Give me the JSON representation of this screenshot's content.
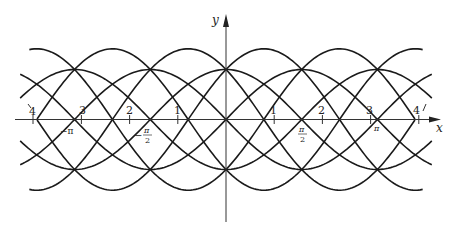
{
  "chart_data": {
    "type": "line",
    "title": "",
    "xlabel": "x",
    "ylabel": "y",
    "xlim": [
      -4.35,
      4.45
    ],
    "ylim": [
      -2.0,
      2.1
    ],
    "grid": false,
    "legend": null,
    "x_ticks": [
      -4,
      -3,
      -2,
      -1,
      1,
      2,
      3,
      4
    ],
    "x_tick_labels": [
      "4",
      "3",
      "2",
      "1",
      "1",
      "2",
      "3",
      "4"
    ],
    "special_labels": [
      {
        "x": -3.14159,
        "text": "−π"
      },
      {
        "x": -1.5708,
        "text": "−π/2"
      },
      {
        "x": 1.5708,
        "text": "π/2"
      },
      {
        "x": 3.14159,
        "text": "π"
      }
    ],
    "series": [
      {
        "name": "sin x",
        "a": 1,
        "b": 0,
        "x_range": [
          -4.27,
          4.27
        ]
      },
      {
        "name": "−sin x",
        "a": -1,
        "b": 0,
        "x_range": [
          -4.27,
          4.27
        ]
      },
      {
        "name": "cos x",
        "a": 0,
        "b": 1,
        "x_range": [
          -4.27,
          4.27
        ]
      },
      {
        "name": "−cos x",
        "a": 0,
        "b": -1,
        "x_range": [
          -4.27,
          4.27
        ]
      },
      {
        "name": "sin x + cos x",
        "a": 1,
        "b": 1,
        "x_range": [
          -3.92,
          4.08
        ]
      },
      {
        "name": "−sin x − cos x",
        "a": -1,
        "b": -1,
        "x_range": [
          -3.92,
          4.08
        ]
      },
      {
        "name": "sin x − cos x",
        "a": 1,
        "b": -1,
        "x_range": [
          -4.08,
          3.92
        ]
      },
      {
        "name": "−sin x + cos x",
        "a": -1,
        "b": 1,
        "x_range": [
          -4.08,
          3.92
        ]
      }
    ]
  },
  "axes": {
    "x_label": "x",
    "y_label": "y",
    "tick_labels": {
      "neg4": "4",
      "neg3": "3",
      "neg2": "2",
      "neg1": "1",
      "pos1": "1",
      "pos2": "2",
      "pos3": "3",
      "pos4": "4"
    },
    "pi_labels": {
      "neg_pi": "−π",
      "neg_half_pi_num": "π",
      "neg_half_pi_den": "2",
      "neg_sign": "−",
      "half_pi_num": "π",
      "half_pi_den": "2",
      "pi": "π"
    }
  }
}
